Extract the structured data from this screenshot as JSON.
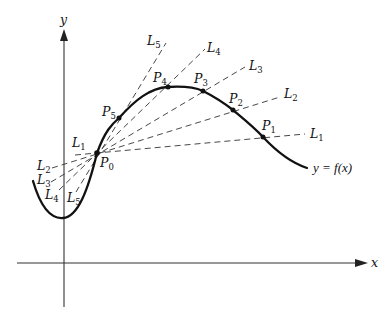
{
  "figure": {
    "axes": {
      "x_label": "x",
      "y_label": "y"
    },
    "curve_label": "y = f(x)",
    "base_point": {
      "name": "P",
      "sub": "0"
    },
    "points": [
      {
        "name": "P",
        "sub": "1"
      },
      {
        "name": "P",
        "sub": "2"
      },
      {
        "name": "P",
        "sub": "3"
      },
      {
        "name": "P",
        "sub": "4"
      },
      {
        "name": "P",
        "sub": "5"
      }
    ],
    "secant_lines": [
      {
        "name": "L",
        "sub": "1",
        "through": "P1"
      },
      {
        "name": "L",
        "sub": "2",
        "through": "P2"
      },
      {
        "name": "L",
        "sub": "3",
        "through": "P3"
      },
      {
        "name": "L",
        "sub": "4",
        "through": "P4"
      },
      {
        "name": "L",
        "sub": "5",
        "through": "P5"
      }
    ],
    "colors": {
      "curve": "#111111",
      "axes": "#333333",
      "secants": "#333333",
      "background": "#ffffff"
    }
  }
}
